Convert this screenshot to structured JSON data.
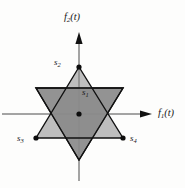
{
  "figure": {
    "type": "signal-constellation-diagram",
    "background_color": "#fdfdfc",
    "fill_color": "#8a8a8a",
    "stroke_color": "#111111",
    "axes": {
      "horizontal": {
        "label_base": "f",
        "label_sub": "1",
        "label_tail": "(t)",
        "name": "f1(t)",
        "y": 114,
        "x_start": 2,
        "x_end": 152,
        "arrow": "right"
      },
      "vertical": {
        "label_base": "f",
        "label_sub": "2",
        "label_tail": "(t)",
        "name": "f2(t)",
        "x": 79,
        "y_start": 181,
        "y_end": 32,
        "arrow": "up"
      }
    },
    "origin": {
      "x": 79,
      "y": 114
    },
    "triangle_up": {
      "name": "upward-triangle",
      "points": "79,67 36,138 123,138",
      "filled": false
    },
    "triangle_down": {
      "name": "downward-triangle",
      "points": "36,88 123,88 79,160",
      "filled": true
    },
    "points": [
      {
        "id": "s1",
        "base": "s",
        "sub": "1",
        "label": "s1",
        "x": 79,
        "y": 114,
        "dot": true,
        "label_x": 82,
        "label_y": 88
      },
      {
        "id": "s2",
        "base": "s",
        "sub": "2",
        "label": "s2",
        "x": 79,
        "y": 67,
        "dot": true,
        "label_x": 54,
        "label_y": 58
      },
      {
        "id": "s3",
        "base": "s",
        "sub": "3",
        "label": "s3",
        "x": 36,
        "y": 138,
        "dot": true,
        "label_x": 17,
        "label_y": 134
      },
      {
        "id": "s4",
        "base": "s",
        "sub": "4",
        "label": "s4",
        "x": 123,
        "y": 138,
        "dot": true,
        "label_x": 130,
        "label_y": 134
      }
    ]
  }
}
